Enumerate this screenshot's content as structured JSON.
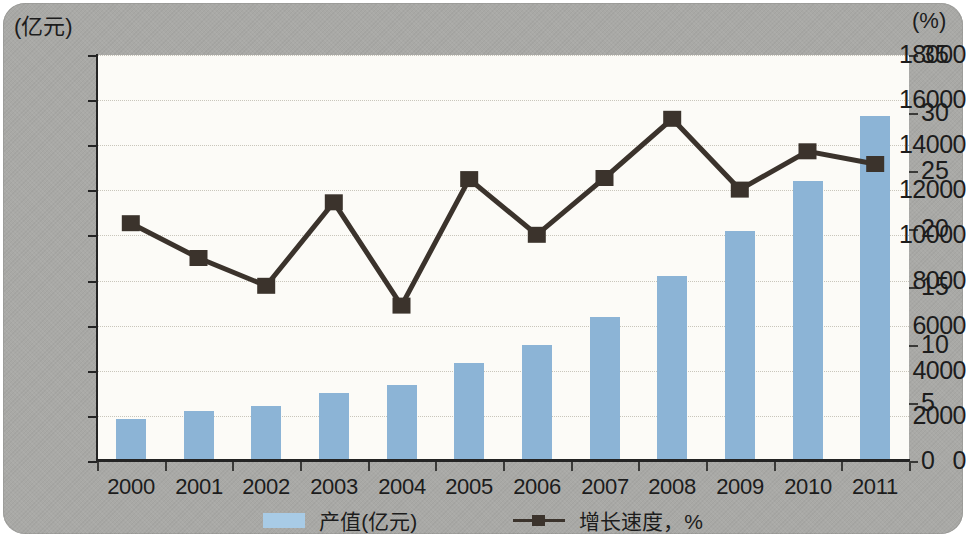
{
  "chart_data": {
    "type": "bar",
    "title": "",
    "subtitle": "",
    "xlabel": "",
    "ylabel": "(亿元)",
    "y2label": "(%)",
    "categories": [
      "2000",
      "2001",
      "2002",
      "2003",
      "2004",
      "2005",
      "2006",
      "2007",
      "2008",
      "2009",
      "2010",
      "2011"
    ],
    "ylim": [
      0,
      18000
    ],
    "y2lim": [
      0,
      35
    ],
    "yticks": [
      0,
      2000,
      4000,
      6000,
      8000,
      10000,
      12000,
      14000,
      16000,
      18000
    ],
    "ytick_labels": [
      "0",
      "2000",
      "4000",
      "6000",
      "8000",
      "10000",
      "12000",
      "14000",
      "16000",
      "18000"
    ],
    "y2ticks": [
      0,
      5,
      10,
      15,
      20,
      25,
      30,
      35
    ],
    "y2tick_labels": [
      "0",
      "5",
      "10",
      "15",
      "20",
      "25",
      "30",
      "35"
    ],
    "grid": true,
    "grid_style": "dotted",
    "legend_position": "bottom",
    "series": [
      {
        "name": "产值(亿元)",
        "type": "bar",
        "axis": "left",
        "color": "#8cb4d6",
        "values": [
          1850,
          2200,
          2450,
          3020,
          3350,
          4330,
          5150,
          6400,
          8200,
          10200,
          12400,
          15300
        ]
      },
      {
        "name": "增长速度，%",
        "type": "line",
        "axis": "right",
        "color": "#3b332c",
        "marker": "square",
        "values": [
          20.5,
          17.5,
          15.1,
          22.3,
          13.4,
          24.3,
          19.5,
          24.4,
          29.5,
          23.4,
          26.7,
          25.6
        ]
      }
    ]
  },
  "legend": {
    "items": [
      {
        "label": "产值(亿元)",
        "marker": "bar-swatch"
      },
      {
        "label": "增长速度，%",
        "marker": "line-square-marker"
      }
    ]
  },
  "colors": {
    "plate_background": "#a9a9a6",
    "plot_background": "#fcfbf7",
    "bar_fill": "#8cb4d6",
    "line_stroke": "#3b332c",
    "axis": "#242424",
    "grid": "#c9c6bb",
    "text": "#1c1c1c"
  }
}
